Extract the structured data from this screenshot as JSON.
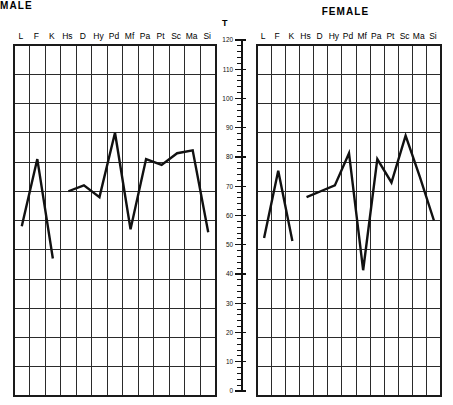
{
  "chart_data": [
    {
      "type": "line",
      "title": "MALE",
      "ylabel": "T",
      "xlabel": "",
      "categories": [
        "L",
        "F",
        "K",
        "Hs",
        "D",
        "Hy",
        "Pd",
        "Mf",
        "Pa",
        "Pt",
        "Sc",
        "Ma",
        "Si"
      ],
      "ylim": [
        0,
        120
      ],
      "ytick_step": 10,
      "yticks": [
        0,
        10,
        20,
        30,
        40,
        50,
        60,
        70,
        80,
        90,
        100,
        110,
        120
      ],
      "minor_tick_step": 2,
      "grid": true,
      "legend": "none",
      "segments": [
        {
          "name": "validity",
          "categories": [
            "L",
            "F",
            "K"
          ],
          "values": [
            58,
            81,
            47
          ]
        },
        {
          "name": "clinical",
          "categories": [
            "Hs",
            "D",
            "Hy",
            "Pd",
            "Mf",
            "Pa",
            "Pt",
            "Sc",
            "Ma",
            "Si"
          ],
          "values": [
            70,
            72,
            68,
            90,
            57,
            81,
            79,
            83,
            84,
            56
          ]
        }
      ],
      "values": [
        58,
        81,
        47,
        70,
        72,
        68,
        90,
        57,
        81,
        79,
        83,
        84,
        56
      ]
    },
    {
      "type": "line",
      "title": "FEMALE",
      "ylabel": "T",
      "xlabel": "",
      "categories": [
        "L",
        "F",
        "K",
        "Hs",
        "D",
        "Hy",
        "Pd",
        "Mf",
        "Pa",
        "Pt",
        "Sc",
        "Ma",
        "Si"
      ],
      "ylim": [
        0,
        120
      ],
      "ytick_step": 10,
      "yticks": [
        0,
        10,
        20,
        30,
        40,
        50,
        60,
        70,
        80,
        90,
        100,
        110,
        120
      ],
      "minor_tick_step": 2,
      "grid": true,
      "legend": "none",
      "segments": [
        {
          "name": "validity",
          "categories": [
            "L",
            "F",
            "K"
          ],
          "values": [
            54,
            77,
            53
          ]
        },
        {
          "name": "clinical",
          "categories": [
            "Hs",
            "D",
            "Hy",
            "Pd",
            "Mf",
            "Pa",
            "Pt",
            "Sc",
            "Ma",
            "Si"
          ],
          "values": [
            68,
            70,
            72,
            83,
            43,
            81,
            73,
            89,
            75,
            60
          ]
        }
      ],
      "values": [
        54,
        77,
        53,
        68,
        70,
        72,
        83,
        43,
        81,
        73,
        89,
        75,
        60
      ]
    }
  ]
}
